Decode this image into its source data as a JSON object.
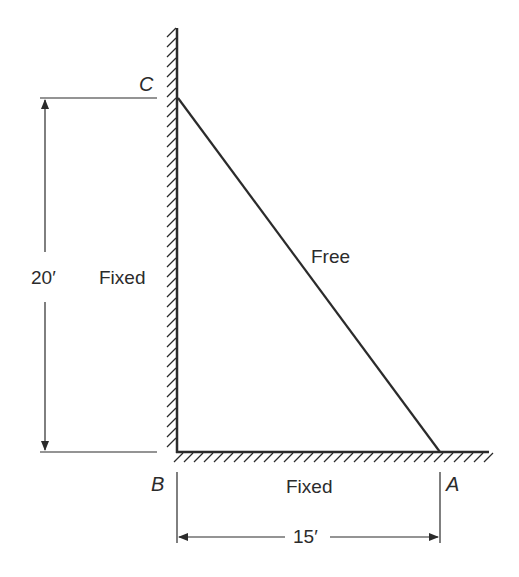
{
  "diagram": {
    "type": "structural-frame",
    "colors": {
      "line": "#2b2b2b",
      "text": "#2b2b2b",
      "background": "#ffffff"
    },
    "points": {
      "A": {
        "label": "A"
      },
      "B": {
        "label": "B"
      },
      "C": {
        "label": "C"
      }
    },
    "members": {
      "BC": {
        "label": "Fixed",
        "description": "vertical wall support from B to C"
      },
      "AB": {
        "label": "Fixed",
        "description": "horizontal ground support from B to A"
      },
      "CA": {
        "label": "Free",
        "description": "diagonal member from C to A"
      }
    },
    "dimensions": {
      "height": {
        "label": "20′",
        "value": 20,
        "unit": "ft"
      },
      "width": {
        "label": "15′",
        "value": 15,
        "unit": "ft"
      }
    }
  }
}
